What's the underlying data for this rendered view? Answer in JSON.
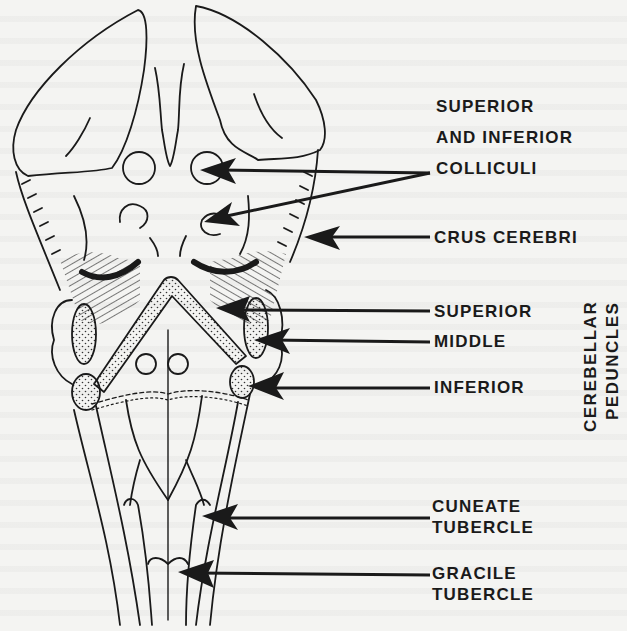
{
  "figure": {
    "labels": {
      "colliculi": [
        "SUPERIOR",
        "AND INFERIOR",
        "COLLICULI"
      ],
      "crus_cerebri": "CRUS CEREBRI",
      "peduncle_superior": "SUPERIOR",
      "peduncle_middle": "MIDDLE",
      "peduncle_inferior": "INFERIOR",
      "peduncles_group": [
        "CEREBELLAR",
        "PEDUNCLES"
      ],
      "cuneate": [
        "CUNEATE",
        "TUBERCLE"
      ],
      "gracile": [
        "GRACILE",
        "TUBERCLE"
      ]
    },
    "colors": {
      "ink": "#1a1a1a",
      "paper": "#f4f4f2"
    }
  }
}
